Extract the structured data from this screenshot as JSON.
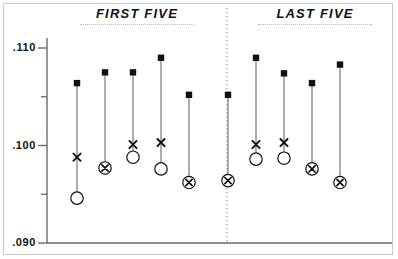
{
  "chart_data": {
    "type": "scatter",
    "title": "",
    "xlabel": "",
    "ylabel": "",
    "ylim": [
      0.09,
      0.112
    ],
    "grid": false,
    "legend_position": "none",
    "axis": {
      "tick_labels": [
        ".110",
        ".100",
        ".090"
      ],
      "tick_values": [
        0.11,
        0.1,
        0.09
      ],
      "minor_tick_values": [
        0.105,
        0.095
      ]
    },
    "groups": [
      {
        "label": "FIRST FIVE",
        "series_indices": [
          0,
          1,
          2,
          3,
          4
        ]
      },
      {
        "label": "LAST FIVE",
        "series_indices": [
          5,
          6,
          7,
          8,
          9
        ]
      }
    ],
    "marker_legend": {
      "square": "high value",
      "x": "mid value",
      "circle": "low value",
      "x-in-circle": "mid and low values coincide"
    },
    "series": [
      {
        "name": "1",
        "group": "FIRST FIVE",
        "square": 0.1064,
        "x": 0.0988,
        "circle": 0.0946,
        "combined": false
      },
      {
        "name": "2",
        "group": "FIRST FIVE",
        "square": 0.1075,
        "x": 0.0977,
        "circle": 0.0977,
        "combined": true
      },
      {
        "name": "3",
        "group": "FIRST FIVE",
        "square": 0.1075,
        "x": 0.1001,
        "circle": 0.0988,
        "combined": false
      },
      {
        "name": "4",
        "group": "FIRST FIVE",
        "square": 0.109,
        "x": 0.1003,
        "circle": 0.0976,
        "combined": false
      },
      {
        "name": "5",
        "group": "FIRST FIVE",
        "square": 0.1052,
        "x": 0.0962,
        "circle": 0.0962,
        "combined": true
      },
      {
        "name": "6",
        "group": "LAST FIVE",
        "square": 0.1052,
        "x": 0.0964,
        "circle": 0.0964,
        "combined": true
      },
      {
        "name": "7",
        "group": "LAST FIVE",
        "square": 0.109,
        "x": 0.1001,
        "circle": 0.0986,
        "combined": false
      },
      {
        "name": "8",
        "group": "LAST FIVE",
        "square": 0.1074,
        "x": 0.1003,
        "circle": 0.0987,
        "combined": false
      },
      {
        "name": "9",
        "group": "LAST FIVE",
        "square": 0.1064,
        "x": 0.0976,
        "circle": 0.0976,
        "combined": true
      },
      {
        "name": "10",
        "group": "LAST FIVE",
        "square": 0.1083,
        "x": 0.0962,
        "circle": 0.0962,
        "combined": true
      }
    ]
  },
  "labels": {
    "tick_high": ".110",
    "tick_mid": ".100",
    "tick_low": ".090",
    "group_first": "FIRST FIVE",
    "group_last": "LAST FIVE"
  },
  "colors": {
    "ink": "#111111",
    "line": "#6a6a6a",
    "axis": "#6a6a6a",
    "frame": "#c9c9c9",
    "divider": "#8a8a8a",
    "background": "#ffffff"
  }
}
